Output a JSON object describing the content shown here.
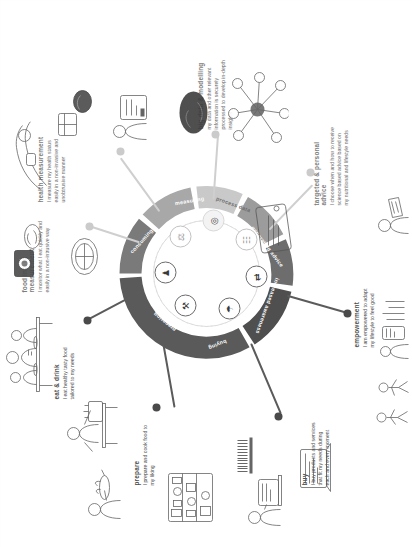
{
  "diagram": {
    "hub": {
      "segments": [
        {
          "id": "preparing",
          "label": "preparing",
          "color": "#5a5a5a"
        },
        {
          "id": "consuming",
          "label": "consuming",
          "color": "#7a7a7a"
        },
        {
          "id": "measuring",
          "label": "measuring",
          "color": "#a8a8a8"
        },
        {
          "id": "process-data",
          "label": "process data",
          "color": "#c9c9c9"
        },
        {
          "id": "generating-advice",
          "label": "generating advice",
          "color": "#9c9c9c"
        },
        {
          "id": "increased-awareness",
          "label": "increased awareness",
          "color": "#6d6d6d"
        },
        {
          "id": "buying",
          "label": "buying",
          "color": "#4f4f4f"
        }
      ],
      "inner_icons": [
        {
          "id": "preparing-icon",
          "glyph": "⚒"
        },
        {
          "id": "consuming-icon",
          "glyph": "♟"
        },
        {
          "id": "measuring-icon",
          "glyph": "⚖"
        },
        {
          "id": "process-icon",
          "glyph": "◎"
        },
        {
          "id": "advice-icon",
          "glyph": "☷"
        },
        {
          "id": "awareness-icon",
          "glyph": "⇄"
        },
        {
          "id": "buying-icon",
          "glyph": "☂"
        }
      ]
    },
    "callouts": [
      {
        "id": "eat-and-drink",
        "title": "eat & drink",
        "body": "I eat healthy tasty food tailored to my needs"
      },
      {
        "id": "food-intake-measurement",
        "title": "food intake measurement",
        "body": "I monitor what I eat quickly and easily in a non-intrusive way"
      },
      {
        "id": "health-measurement",
        "title": "health measurement",
        "body": "I measure my health status easily in a non-invasive and unobtrusive manner"
      },
      {
        "id": "big-data-and-modelling",
        "title": "big data & modelling",
        "body": "my data and other relevant information is securely processed to develop in-depth insights"
      },
      {
        "id": "targeted-and-personal-advice",
        "title": "targeted & personal advice",
        "body": "I choose when and how to receive science based advice based on my nutritional and lifestyle needs"
      },
      {
        "id": "empowerment",
        "title": "empowerment",
        "body": "I am empowered to adapt my lifestyle to feel good"
      },
      {
        "id": "buy",
        "title": "buy",
        "body": "I buy products and services that fit my needs during each and every moment"
      },
      {
        "id": "prepare",
        "title": "prepare",
        "body": "I prepare and cook food to my liking"
      }
    ],
    "colors": {
      "dark_spoke": "#4a4a4a",
      "light_spoke": "#cbcbcb",
      "title_grey": "#7d7d7d",
      "body_grey": "#6a6a6a"
    }
  }
}
